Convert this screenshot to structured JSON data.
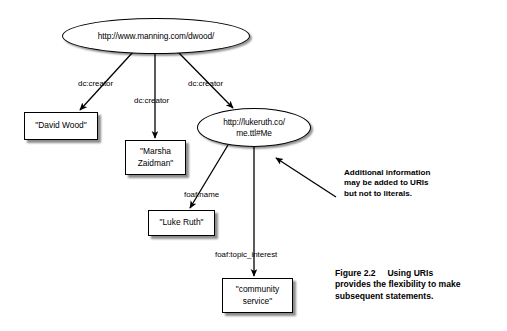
{
  "figure": {
    "caption_label": "Figure 2.2",
    "caption_line1": "Using URIs",
    "caption_line2": "provides the flexibility to make",
    "caption_line3": "subsequent statements."
  },
  "annotation": {
    "line1": "Additional information",
    "line2": "may be added to URIs",
    "line3": "but not to literals."
  },
  "nodes": {
    "manning_uri": {
      "label": "http://www.manning.com/dwood/",
      "type": "uri"
    },
    "lukeruth_uri": {
      "line1": "http://lukeruth.co/",
      "line2": "me.ttl#Me",
      "type": "uri"
    },
    "david_wood": {
      "label": "\"David Wood\"",
      "type": "literal"
    },
    "marsha_zaidman": {
      "line1": "\"Marsha",
      "line2": "Zaidman\"",
      "type": "literal"
    },
    "luke_ruth": {
      "label": "\"Luke Ruth\"",
      "type": "literal"
    },
    "community_service": {
      "line1": "\"community",
      "line2": "service\"",
      "type": "literal"
    }
  },
  "edges": {
    "creator_david": "dc:creator",
    "creator_marsha": "dc:creator",
    "creator_lukeruth": "dc:creator",
    "foaf_name": "foaf:name",
    "foaf_topic_interest": "foaf:topic_interest"
  },
  "colors": {
    "stroke": "#000000",
    "background": "#ffffff",
    "shadow": "rgba(0,0,0,0.45)"
  }
}
